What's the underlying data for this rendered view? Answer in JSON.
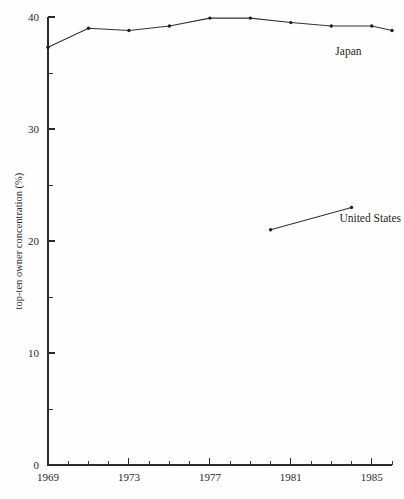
{
  "chart_data": {
    "type": "line",
    "title": "",
    "subtitle": "",
    "xlabel": "",
    "ylabel": "top-ten owner concentration (%)",
    "xlim": [
      1969,
      1986
    ],
    "ylim": [
      0,
      40
    ],
    "grid": false,
    "legend_position": "inline-annotation",
    "y_ticks_major": [
      0,
      10,
      20,
      30,
      40
    ],
    "y_tick_labels": [
      "0",
      "10",
      "20",
      "30",
      "40"
    ],
    "y_ticks_minor": [
      5,
      15,
      25,
      35
    ],
    "x_ticks_major": [
      1969,
      1973,
      1977,
      1981,
      1985
    ],
    "x_tick_labels": [
      "1969",
      "1973",
      "1977",
      "1981",
      "1985"
    ],
    "x_ticks_minor": [
      1970,
      1971,
      1972,
      1974,
      1975,
      1976,
      1978,
      1979,
      1980,
      1982,
      1983,
      1984,
      1986
    ],
    "series": [
      {
        "name": "Japan",
        "label": "Japan",
        "label_x": 1983.2,
        "label_y": 36.6,
        "x": [
          1969,
          1970,
          1971,
          1972,
          1973,
          1974,
          1975,
          1976,
          1977,
          1978
        ],
        "x_years": [
          1969,
          1971,
          1973,
          1975,
          1977,
          1979,
          1981,
          1983,
          1985,
          1986
        ],
        "values": [
          37.3,
          39.0,
          38.8,
          39.2,
          39.9,
          39.9,
          39.5,
          39.2,
          39.2,
          38.8
        ]
      },
      {
        "name": "United States",
        "label": "United States",
        "label_x": 1983.4,
        "label_y": 21.7,
        "x_years": [
          1980,
          1984
        ],
        "values": [
          21.0,
          23.0
        ]
      }
    ]
  },
  "figure": {
    "background_color": "#fefefe",
    "ink_color": "#2b2b2b"
  }
}
